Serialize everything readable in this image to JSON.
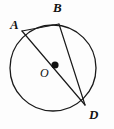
{
  "figure": {
    "kind": "circle-geometry-diagram",
    "canvas": {
      "width": 114,
      "height": 129
    },
    "background_color": "#fdfdfd",
    "stroke_color": "#1a1a1a",
    "label_color": "#121212"
  },
  "circle": {
    "name": "circle-O",
    "center": {
      "x": 53,
      "y": 68
    },
    "radius": 43,
    "stroke_width": 1.3,
    "fill": "none"
  },
  "center_dot": {
    "name": "center-point-O",
    "x": 55,
    "y": 65,
    "radius": 3.6,
    "fill": "#111111"
  },
  "points": [
    {
      "id": "A",
      "label": "A",
      "x": 22,
      "y": 31,
      "label_x": 10,
      "label_y": 18
    },
    {
      "id": "B",
      "label": "B",
      "x": 59,
      "y": 24,
      "label_x": 53,
      "label_y": 1
    },
    {
      "id": "O",
      "label": "O",
      "x": 55,
      "y": 65,
      "label_x": 40,
      "label_y": 67
    },
    {
      "id": "D",
      "label": "D",
      "x": 85,
      "y": 105,
      "label_x": 89,
      "label_y": 108
    }
  ],
  "segments": [
    {
      "id": "AD",
      "name": "diameter-A-to-D",
      "from": "A",
      "to": "D",
      "x1": 22,
      "y1": 31,
      "x2": 85,
      "y2": 105,
      "stroke_width": 1.2,
      "note": "diameter through center O"
    },
    {
      "id": "BD",
      "name": "chord-B-to-D",
      "from": "B",
      "to": "D",
      "x1": 59,
      "y1": 24,
      "x2": 85,
      "y2": 105,
      "stroke_width": 1.2,
      "note": "chord"
    },
    {
      "id": "AB",
      "name": "chord-A-to-B",
      "from": "A",
      "to": "B",
      "x1": 22,
      "y1": 31,
      "x2": 59,
      "y2": 24,
      "stroke_width": 1.2,
      "note": "chord"
    }
  ]
}
